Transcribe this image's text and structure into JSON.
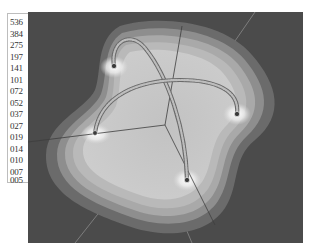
{
  "legend": {
    "labels": [
      "536",
      "384",
      "275",
      "197",
      "141",
      "101",
      "072",
      "052",
      "037",
      "027",
      "019",
      "014",
      "010",
      "007",
      "005"
    ]
  },
  "scene": {
    "background": "#4b4b4b",
    "contour_colors": [
      "#6a6a6a",
      "#8c8c8c",
      "#a8a8a8",
      "#b8b8b8",
      "#c4c4c4",
      "#cfcfcf"
    ],
    "nodes": [
      {
        "name": "node-top-left",
        "x": 114,
        "y": 66
      },
      {
        "name": "node-right",
        "x": 237,
        "y": 114
      },
      {
        "name": "node-left",
        "x": 95,
        "y": 133
      },
      {
        "name": "node-bottom",
        "x": 187,
        "y": 180
      }
    ],
    "axis_center": {
      "x": 165,
      "y": 125
    }
  }
}
